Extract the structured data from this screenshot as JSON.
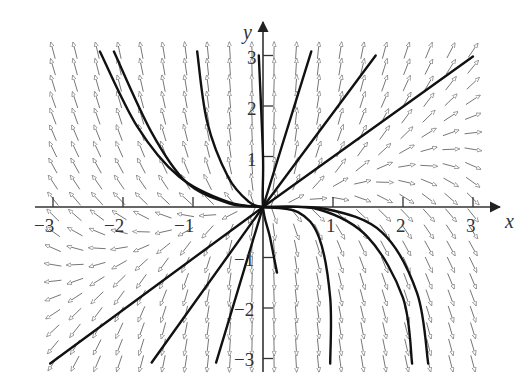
{
  "chart_data": {
    "type": "direction_field",
    "title": "",
    "xlabel": "x",
    "ylabel": "y",
    "xlim": [
      -3.15,
      3.15
    ],
    "ylim": [
      -3.1,
      3.1
    ],
    "grid": false,
    "legend": null,
    "x_ticks": [
      -3,
      -2,
      -1,
      1,
      2,
      3
    ],
    "y_ticks": [
      -3,
      -2,
      -1,
      1,
      2,
      3
    ],
    "x_tick_labels": [
      "−3",
      "−2",
      "−1",
      "1",
      "2",
      "3"
    ],
    "y_tick_labels": [
      "−3",
      "−2",
      "−1",
      "1",
      "2",
      "3"
    ],
    "field_description": "Slope field with arrows on a ~0.3-unit grid; node at origin. Arrows point away from origin: up-left in quadrant II, right/up-right in quadrant I, left/down-left in quadrant III, down in quadrant IV.",
    "field_grid": {
      "x_range": [
        -3.0,
        3.0
      ],
      "y_range": [
        -3.1,
        3.1
      ],
      "cols": 20,
      "rows": 20
    },
    "trajectories": [
      {
        "quadrant": "I",
        "shape": "line",
        "points": [
          [
            0,
            0
          ],
          [
            0.69,
            3.08
          ]
        ]
      },
      {
        "quadrant": "I",
        "shape": "line",
        "points": [
          [
            0,
            0
          ],
          [
            1.61,
            3.0
          ]
        ]
      },
      {
        "quadrant": "I",
        "shape": "line",
        "points": [
          [
            0,
            0
          ],
          [
            3.0,
            2.98
          ]
        ]
      },
      {
        "quadrant": "III",
        "shape": "line",
        "points": [
          [
            0,
            0
          ],
          [
            -3.04,
            -3.1
          ]
        ]
      },
      {
        "quadrant": "III",
        "shape": "line",
        "points": [
          [
            0,
            0
          ],
          [
            -1.59,
            -3.08
          ]
        ]
      },
      {
        "quadrant": "III",
        "shape": "line",
        "points": [
          [
            0,
            0
          ],
          [
            -0.67,
            -3.08
          ]
        ]
      },
      {
        "quadrant": "II",
        "shape": "curve",
        "points": [
          [
            0,
            0
          ],
          [
            -0.5,
            0.1
          ],
          [
            -1.2,
            0.6
          ],
          [
            -1.8,
            1.6
          ],
          [
            -2.33,
            3.08
          ]
        ]
      },
      {
        "quadrant": "II",
        "shape": "curve",
        "points": [
          [
            0,
            0
          ],
          [
            -0.5,
            0.08
          ],
          [
            -1.1,
            0.5
          ],
          [
            -1.6,
            1.5
          ],
          [
            -2.13,
            3.08
          ]
        ]
      },
      {
        "quadrant": "II",
        "shape": "curve",
        "points": [
          [
            0,
            0
          ],
          [
            -0.2,
            0.1
          ],
          [
            -0.5,
            0.6
          ],
          [
            -0.8,
            1.7
          ],
          [
            -0.94,
            3.08
          ]
        ]
      },
      {
        "quadrant": "IV",
        "shape": "curve",
        "points": [
          [
            0,
            0
          ],
          [
            0.5,
            -0.1
          ],
          [
            0.8,
            -0.6
          ],
          [
            0.96,
            -1.8
          ],
          [
            0.96,
            -3.1
          ]
        ]
      },
      {
        "quadrant": "IV",
        "shape": "curve",
        "points": [
          [
            0,
            0
          ],
          [
            0.8,
            -0.05
          ],
          [
            1.5,
            -0.6
          ],
          [
            2.0,
            -1.8
          ],
          [
            2.13,
            -3.1
          ]
        ]
      },
      {
        "quadrant": "IV",
        "shape": "curve",
        "points": [
          [
            0,
            0
          ],
          [
            0.9,
            -0.04
          ],
          [
            1.7,
            -0.5
          ],
          [
            2.2,
            -1.7
          ],
          [
            2.36,
            -3.1
          ]
        ]
      },
      {
        "quadrant": "II-IV",
        "shape": "s-curve",
        "points": [
          [
            -0.06,
            3.0
          ],
          [
            0,
            1.0
          ],
          [
            0,
            0
          ],
          [
            0.1,
            -0.6
          ],
          [
            0.2,
            -1.3
          ]
        ]
      }
    ]
  },
  "axes": {
    "x_label": "x",
    "y_label": "y",
    "x_tick_labels": [
      "−3",
      "−2",
      "−1",
      "1",
      "2",
      "3"
    ],
    "y_tick_labels": [
      "3",
      "2",
      "1",
      "−1",
      "−2",
      "−3"
    ]
  }
}
